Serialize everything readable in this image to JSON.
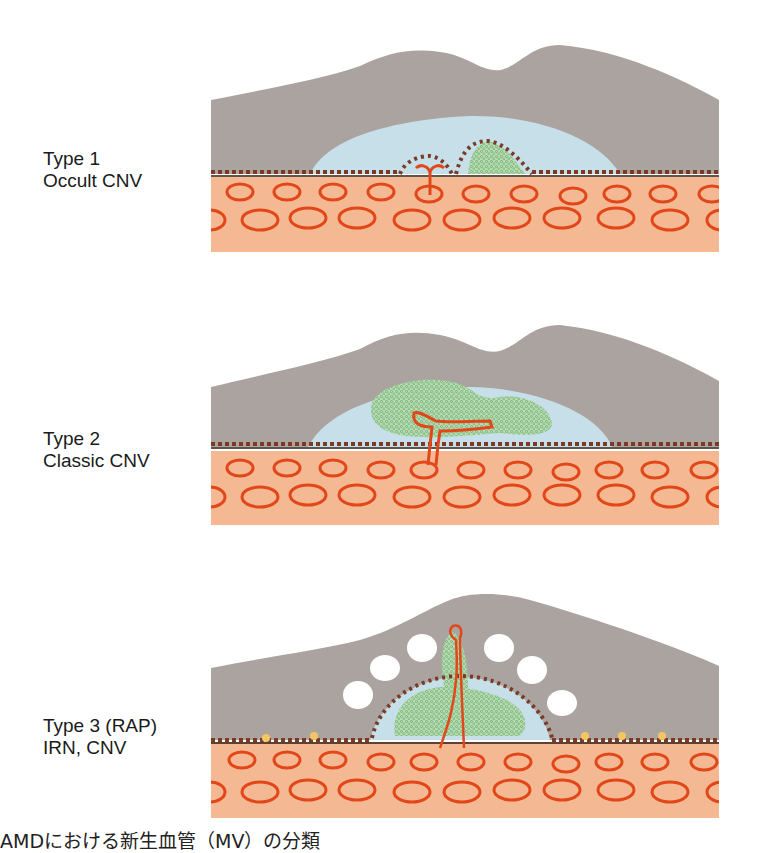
{
  "figure": {
    "caption": "AMDにおける新生血管（MV）の分類",
    "colors": {
      "retina_gray": "#aaa39f",
      "fluid_blue": "#c6dfe8",
      "choroid_orange": "#f4b893",
      "vessel_red": "#e2471a",
      "rpe_dot_brown": "#7a3a26",
      "neovascular_green": "#9ccb9a",
      "drusen_yellow": "#f2c660"
    },
    "panels": [
      {
        "id": "type1",
        "label_line1": "Type 1",
        "label_line2": "Occult CNV",
        "description": "CNV beneath the RPE (sub-RPE), RPE elevated"
      },
      {
        "id": "type2",
        "label_line1": "Type 2",
        "label_line2": "Classic CNV",
        "description": "CNV above the RPE (subretinal), breaching RPE"
      },
      {
        "id": "type3",
        "label_line1": "Type 3 (RAP)",
        "label_line2": "IRN, CNV",
        "description": "Intraretinal neovascularization with cystoid spaces"
      }
    ]
  }
}
